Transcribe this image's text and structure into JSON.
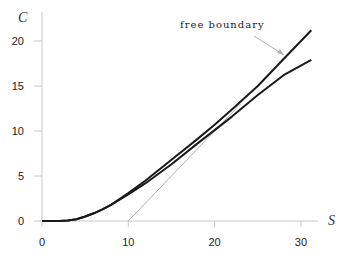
{
  "chart_data": {
    "type": "line",
    "title": "",
    "xlabel": "S",
    "ylabel": "C",
    "xlim": [
      0,
      31
    ],
    "ylim": [
      0,
      21
    ],
    "x_ticks": [
      "0",
      "10",
      "20",
      "30"
    ],
    "y_ticks": [
      "0",
      "5",
      "10",
      "15",
      "20"
    ],
    "grid": false,
    "legend": null,
    "annotations": [
      {
        "text": "free boundary",
        "arrow_to": {
          "S": 28.4,
          "C": 18.4
        }
      }
    ],
    "series": [
      {
        "name": "upper curve",
        "color": "#1a1a1a",
        "x": [
          0,
          2,
          3,
          4,
          5,
          6,
          7,
          8,
          10,
          12,
          15,
          18,
          20,
          22,
          25,
          28,
          31.2
        ],
        "y": [
          0,
          0,
          0.05,
          0.2,
          0.5,
          0.85,
          1.3,
          1.8,
          3.1,
          4.5,
          6.8,
          9.1,
          10.7,
          12.4,
          15.0,
          18.0,
          21.2
        ]
      },
      {
        "name": "lower curve",
        "color": "#1a1a1a",
        "x": [
          0,
          2,
          3,
          4,
          5,
          6,
          7,
          8,
          10,
          12,
          15,
          18,
          20,
          22,
          25,
          28,
          31.2
        ],
        "y": [
          0,
          0,
          0.05,
          0.2,
          0.5,
          0.85,
          1.3,
          1.8,
          2.95,
          4.2,
          6.3,
          8.6,
          10.1,
          11.6,
          14.0,
          16.2,
          17.9
        ]
      },
      {
        "name": "payoff line",
        "color": "#b0b0b0",
        "x": [
          10,
          23
        ],
        "y": [
          0,
          13
        ]
      }
    ]
  }
}
